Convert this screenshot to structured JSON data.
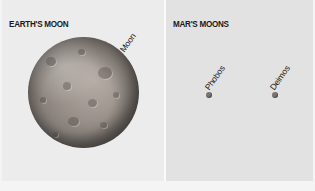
{
  "left_panel": {
    "title": "EARTH'S MOON",
    "moon_label": "Moon"
  },
  "right_panel": {
    "title": "MAR'S MOONS",
    "moons": [
      {
        "label": "Phobos"
      },
      {
        "label": "Deimos"
      }
    ]
  },
  "colors": {
    "left_background": "#ececec",
    "right_background": "#e2e2e2",
    "moon_base": "#9a928b",
    "dot": "#7a7472"
  }
}
